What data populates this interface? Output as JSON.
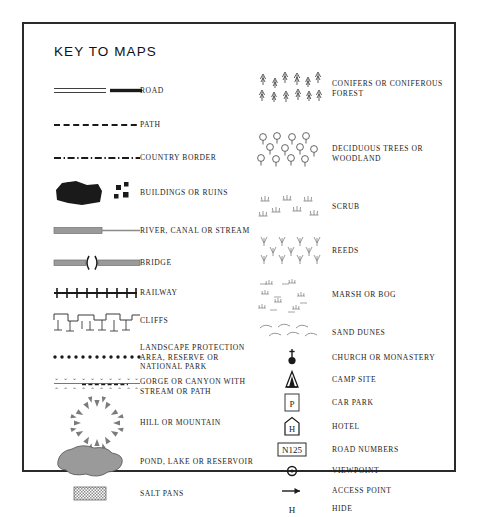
{
  "title": "KEY TO MAPS",
  "colors": {
    "border": "#2a2a2a",
    "ink": "#1d1d1d",
    "gray": "#8a8a8a",
    "water": "#9a9a9a",
    "background": "#ffffff"
  },
  "left_column": [
    {
      "icon": "road-symbol",
      "label": "ROAD"
    },
    {
      "icon": "path-symbol",
      "label": "PATH"
    },
    {
      "icon": "country-border-symbol",
      "label": "COUNTRY BORDER"
    },
    {
      "icon": "buildings-ruins-symbol",
      "label": "BUILDINGS OR RUINS"
    },
    {
      "icon": "river-canal-stream-symbol",
      "label": "RIVER, CANAL OR STREAM"
    },
    {
      "icon": "bridge-symbol",
      "label": "BRIDGE"
    },
    {
      "icon": "railway-symbol",
      "label": "RAILWAY"
    },
    {
      "icon": "cliffs-symbol",
      "label": "CLIFFS"
    },
    {
      "icon": "landscape-protection-symbol",
      "label": "LANDSCAPE PROTECTION AREA, RESERVE OR NATIONAL PARK"
    },
    {
      "icon": "gorge-canyon-symbol",
      "label": "GORGE OR CANYON WITH STREAM OR PATH"
    },
    {
      "icon": "hill-mountain-symbol",
      "label": "HILL OR MOUNTAIN"
    },
    {
      "icon": "pond-lake-reservoir-symbol",
      "label": "POND, LAKE OR RESERVOIR"
    },
    {
      "icon": "salt-pans-symbol",
      "label": "SALT PANS"
    }
  ],
  "right_column": [
    {
      "icon": "conifers-symbol",
      "label": "CONIFERS OR CONIFEROUS FOREST"
    },
    {
      "icon": "deciduous-trees-symbol",
      "label": "DECIDUOUS TREES OR WOODLAND"
    },
    {
      "icon": "scrub-symbol",
      "label": "SCRUB"
    },
    {
      "icon": "reeds-symbol",
      "label": "REEDS"
    },
    {
      "icon": "marsh-bog-symbol",
      "label": "MARSH OR BOG"
    },
    {
      "icon": "sand-dunes-symbol",
      "label": "SAND DUNES"
    },
    {
      "icon": "church-monastery-symbol",
      "label": "CHURCH OR MONASTERY"
    },
    {
      "icon": "camp-site-symbol",
      "label": "CAMP SITE"
    },
    {
      "icon": "car-park-symbol",
      "label": "CAR PARK",
      "glyph": "P"
    },
    {
      "icon": "hotel-symbol",
      "label": "HOTEL",
      "glyph": "H"
    },
    {
      "icon": "road-numbers-symbol",
      "label": "ROAD NUMBERS",
      "glyph": "N125"
    },
    {
      "icon": "viewpoint-symbol",
      "label": "VIEWPOINT"
    },
    {
      "icon": "access-point-symbol",
      "label": "ACCESS POINT"
    },
    {
      "icon": "hide-symbol",
      "label": "HIDE",
      "glyph": "H"
    }
  ]
}
